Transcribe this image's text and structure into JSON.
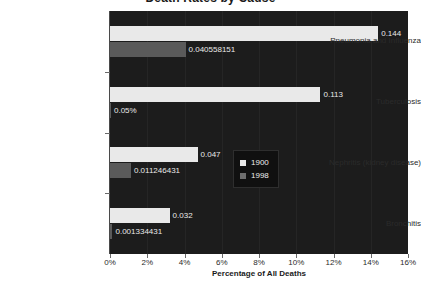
{
  "chart_data": {
    "type": "bar",
    "orientation": "horizontal",
    "title": "Death Rates by Cause",
    "xlabel": "Percentage of All Deaths",
    "ylabel": "",
    "xlim": [
      0,
      16
    ],
    "xunit": "%",
    "grid": false,
    "legend_position": "inside-bottom-right",
    "categories": [
      "Pneumonia and Influenza",
      "Tuberculosis",
      "Nephritis (kidney disease)",
      "Bronchitis"
    ],
    "series": [
      {
        "name": "1900",
        "color": "#e9e9e9",
        "values": [
          14.4,
          11.3,
          4.7,
          3.2
        ],
        "labels": [
          "0.144",
          "0.113",
          "0.047",
          "0.032"
        ]
      },
      {
        "name": "1998",
        "color": "#5a5a5a",
        "values": [
          4.0558151,
          0.05,
          1.1246431,
          0.1334431
        ],
        "labels": [
          "0.040558151",
          "0.05%",
          "0.011246431",
          "0.001334431"
        ]
      }
    ],
    "xticks": [
      "0%",
      "2%",
      "4%",
      "6%",
      "8%",
      "10%",
      "12%",
      "14%",
      "16%"
    ]
  },
  "legend": {
    "entries": [
      {
        "label": "1900"
      },
      {
        "label": "1998"
      }
    ]
  },
  "colors": {
    "plot_background": "#1c1c1c",
    "series_1900": "#e9e9e9",
    "series_1998": "#5a5a5a",
    "value_text": "#e9e9e9",
    "axis_text": "#2b2b2b"
  }
}
